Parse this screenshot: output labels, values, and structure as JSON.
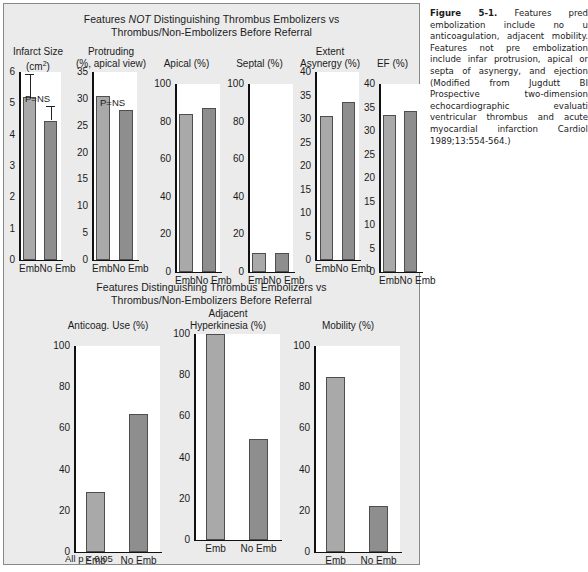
{
  "figure": {
    "top_section_title_1": "Features NOT Distinguishing Thrombus Embolizers vs",
    "top_section_title_1_pre": "Features ",
    "top_section_title_1_it": "NOT",
    "top_section_title_1_post": " Distinguishing Thrombus Embolizers vs",
    "top_section_title_2": "Thrombus/Non-Embolizers Before Referral",
    "bottom_section_title_1": "Features Distinguishing Thrombus Embolizers vs",
    "bottom_section_title_2": "Thrombus/Non-Embolizers Before Referral",
    "p_note": "All p < 0.05"
  },
  "caption": {
    "label": "Figure 5-1.",
    "text": " Features pred embolization include no u anticoagulation, adjacent mobility. Features not pre embolization include infar protrusion, apical or septa of asynergy, and ejection (Modified from Jugdutt BI Prospective two-dimension echocardiographic evaluati ventricular thrombus and acute myocardial infarction Cardiol 1989;13:554-564.)"
  },
  "chart_data": [
    {
      "type": "bar",
      "title_line1": "Infarct Size",
      "title_line2": "(cm2)",
      "title_line2_main": "(cm",
      "title_line2_sup": "2",
      "title_line2_tail": ")",
      "categories": [
        "Emb",
        "No Emb"
      ],
      "values": [
        5.2,
        4.45
      ],
      "errors_upper": [
        5.95,
        4.9
      ],
      "annotation": "P=NS",
      "ylim": [
        0,
        6
      ],
      "yticks": [
        0,
        1,
        2,
        3,
        4,
        5,
        6
      ],
      "ylabel": "",
      "grid": false
    },
    {
      "type": "bar",
      "title_line1": "Protruding",
      "title_line2": "(%, apical view)",
      "categories": [
        "Emb",
        "No Emb"
      ],
      "values": [
        30.5,
        28.0
      ],
      "annotation": "P=NS",
      "ylim": [
        0,
        35
      ],
      "yticks": [
        0,
        5,
        10,
        15,
        20,
        25,
        30,
        35
      ],
      "grid": false
    },
    {
      "type": "bar",
      "title_line1": "Apical (%)",
      "title_line2": "",
      "categories": [
        "Emb",
        "No Emb"
      ],
      "values": [
        84,
        87
      ],
      "annotation": "",
      "ylim": [
        0,
        100
      ],
      "yticks": [
        0,
        20,
        40,
        60,
        80,
        100
      ],
      "grid": false
    },
    {
      "type": "bar",
      "title_line1": "Septal (%)",
      "title_line2": "",
      "categories": [
        "Emb",
        "No Emb"
      ],
      "values": [
        10,
        10
      ],
      "annotation": "",
      "ylim": [
        0,
        100
      ],
      "yticks": [
        0,
        20,
        40,
        60,
        80,
        100
      ],
      "grid": false
    },
    {
      "type": "bar",
      "title_line1": "Extent",
      "title_line2": "Asynergy (%)",
      "categories": [
        "Emb",
        "No Emb"
      ],
      "values": [
        30.7,
        33.7
      ],
      "annotation": "",
      "ylim": [
        0,
        40
      ],
      "yticks": [
        0,
        5,
        10,
        15,
        20,
        25,
        30,
        35,
        40
      ],
      "grid": false
    },
    {
      "type": "bar",
      "title_line1": "EF (%)",
      "title_line2": "",
      "categories": [
        "Emb",
        "No Emb"
      ],
      "values": [
        33.5,
        34.3
      ],
      "annotation": "",
      "ylim": [
        0,
        40
      ],
      "yticks": [
        0,
        5,
        10,
        15,
        20,
        25,
        30,
        35,
        40
      ],
      "grid": false
    },
    {
      "type": "bar",
      "title_line1": "Anticoag. Use (%)",
      "title_line2": "",
      "categories": [
        "Emb",
        "No Emb"
      ],
      "values": [
        29,
        67
      ],
      "annotation": "",
      "ylim": [
        0,
        100
      ],
      "yticks": [
        0,
        20,
        40,
        60,
        80,
        100
      ],
      "grid": false
    },
    {
      "type": "bar",
      "title_line1": "Adjacent",
      "title_line2": "Hyperkinesia (%)",
      "categories": [
        "Emb",
        "No Emb"
      ],
      "values": [
        100,
        49
      ],
      "annotation": "",
      "ylim": [
        0,
        100
      ],
      "yticks": [
        0,
        20,
        40,
        60,
        80,
        100
      ],
      "grid": false
    },
    {
      "type": "bar",
      "title_line1": "Mobility (%)",
      "title_line2": "",
      "categories": [
        "Emb",
        "No Emb"
      ],
      "values": [
        85,
        22.5
      ],
      "annotation": "",
      "ylim": [
        0,
        100
      ],
      "yticks": [
        0,
        20,
        40,
        60,
        80,
        100
      ],
      "grid": false
    }
  ],
  "colors": {
    "bar_light": "#a9a9a9",
    "bar_dark": "#8e8e8e",
    "panel_bg": "#ebebeb",
    "plot_bg": "#ffffff",
    "axis": "#111111"
  }
}
